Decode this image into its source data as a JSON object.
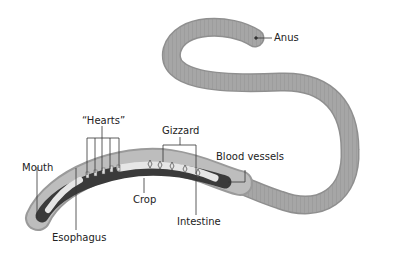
{
  "diagram": {
    "labels": {
      "anus": "Anus",
      "hearts": "“Hearts”",
      "gizzard": "Gizzard",
      "blood_vessels": "Blood vessels",
      "mouth": "Mouth",
      "crop": "Crop",
      "intestine": "Intestine",
      "esophagus": "Esophagus"
    },
    "colors": {
      "body": "#a9a9a9",
      "body_dark": "#8a8a8a",
      "gut_dark": "#3a3a3a",
      "gut_light": "#e6e6e6",
      "leader_line": "#333333"
    }
  }
}
